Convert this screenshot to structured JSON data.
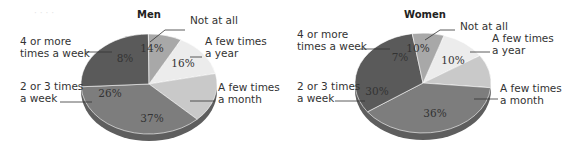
{
  "chart_data": [
    {
      "type": "pie",
      "title": "Men",
      "categories": [
        "Not at all",
        "A few times a year",
        "A few times a month",
        "2 or 3 times a week",
        "4 or more times a week"
      ],
      "values": [
        14,
        16,
        37,
        26,
        8
      ],
      "value_labels": [
        "14%",
        "16%",
        "37%",
        "26%",
        "8%"
      ],
      "label_lines": [
        [
          "Not at all"
        ],
        [
          "A few times",
          "a year"
        ],
        [
          "A few times",
          "a month"
        ],
        [
          "2 or 3 times",
          "a week"
        ],
        [
          "4 or more",
          "times a week"
        ]
      ],
      "colors": [
        "#ececec",
        "#c9c9c9",
        "#7d7d7d",
        "#5a5a5a",
        "#a8a8a8"
      ]
    },
    {
      "type": "pie",
      "title": "Women",
      "categories": [
        "Not at all",
        "A few times a year",
        "A few times a month",
        "2 or 3 times a week",
        "4 or more times a week"
      ],
      "values": [
        10,
        10,
        36,
        30,
        7
      ],
      "value_labels": [
        "10%",
        "10%",
        "36%",
        "30%",
        "7%"
      ],
      "label_lines": [
        [
          "Not at all"
        ],
        [
          "A few times",
          "a year"
        ],
        [
          "A few times",
          "a month"
        ],
        [
          "2 or 3 times",
          "a week"
        ],
        [
          "4 or more",
          "times a week"
        ]
      ],
      "colors": [
        "#ececec",
        "#c9c9c9",
        "#7d7d7d",
        "#5a5a5a",
        "#a8a8a8"
      ]
    }
  ]
}
